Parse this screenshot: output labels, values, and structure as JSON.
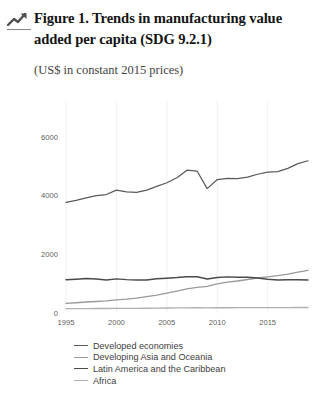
{
  "header": {
    "icon": "trending-up-icon",
    "title": "Figure 1. Trends in manufacturing value added per capita (SDG 9.2.1)",
    "subtitle": "(US$ in constant 2015 prices)"
  },
  "footer": {
    "cut_text": ""
  },
  "colors": {
    "developed": "#5a5a5a",
    "developing_asia": "#9a9a9a",
    "latin_america": "#4a4a4a",
    "africa": "#b0b0b0",
    "gridline": "#e9e9e9",
    "tick_text": "#5d5d5d",
    "title_text": "#141414"
  },
  "chart_data": {
    "type": "line",
    "title": "Figure 1. Trends in manufacturing value added per capita (SDG 9.2.1)",
    "subtitle": "(US$ in constant 2015 prices)",
    "xlabel": "",
    "ylabel": "",
    "ylim": [
      0,
      6600
    ],
    "xlim": [
      1995,
      2019
    ],
    "yticks": [
      0,
      2000,
      4000,
      6000
    ],
    "ytick_labels": [
      "0",
      "2000",
      "4000",
      "6000"
    ],
    "xticks": [
      1995,
      2000,
      2005,
      2010,
      2015
    ],
    "xtick_labels": [
      "1995",
      "2000",
      "2005",
      "2010",
      "2015"
    ],
    "grid": true,
    "legend_position": "bottom",
    "x": [
      1995,
      1996,
      1997,
      1998,
      1999,
      2000,
      2001,
      2002,
      2003,
      2004,
      2005,
      2006,
      2007,
      2008,
      2009,
      2010,
      2011,
      2012,
      2013,
      2014,
      2015,
      2016,
      2017,
      2018,
      2019
    ],
    "series": [
      {
        "name": "Developed economies",
        "color": "#5a5a5a",
        "values": [
          3760,
          3830,
          3920,
          3990,
          4030,
          4180,
          4120,
          4100,
          4180,
          4310,
          4430,
          4600,
          4860,
          4830,
          4230,
          4540,
          4580,
          4570,
          4620,
          4720,
          4790,
          4810,
          4920,
          5080,
          5180
        ]
      },
      {
        "name": "Developing Asia and Oceania",
        "color": "#9a9a9a",
        "values": [
          330,
          350,
          375,
          390,
          410,
          445,
          470,
          505,
          555,
          610,
          675,
          745,
          820,
          870,
          905,
          990,
          1050,
          1090,
          1140,
          1190,
          1230,
          1270,
          1320,
          1390,
          1450
        ]
      },
      {
        "name": "Latin America and the Caribbean",
        "color": "#4a4a4a",
        "values": [
          1130,
          1150,
          1175,
          1155,
          1125,
          1160,
          1135,
          1125,
          1120,
          1165,
          1185,
          1205,
          1235,
          1235,
          1155,
          1210,
          1230,
          1215,
          1215,
          1190,
          1150,
          1120,
          1130,
          1130,
          1120
        ]
      },
      {
        "name": "Africa",
        "color": "#b0b0b0",
        "values": [
          148,
          149,
          151,
          152,
          153,
          156,
          157,
          159,
          162,
          166,
          170,
          173,
          177,
          179,
          176,
          180,
          179,
          181,
          183,
          185,
          185,
          184,
          185,
          186,
          187
        ]
      }
    ]
  }
}
